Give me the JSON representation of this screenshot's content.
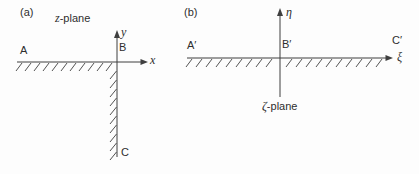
{
  "figure": {
    "background": "#fdfdfd",
    "line_color": "#3f3f3f",
    "text_color": "#2e2e2e"
  },
  "panel_a": {
    "tag": "(a)",
    "plane_letter": "z",
    "plane_suffix": "-plane",
    "x_axis_label": "x",
    "y_axis_label": "y",
    "point_A": "A",
    "point_B": "B",
    "point_C": "C"
  },
  "panel_b": {
    "tag": "(b)",
    "plane_letter": "ζ",
    "plane_suffix": "-plane",
    "xi_axis_label": "ξ",
    "eta_axis_label": "η",
    "point_A": "A′",
    "point_B": "B′",
    "point_C": "C′"
  }
}
